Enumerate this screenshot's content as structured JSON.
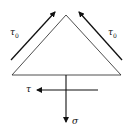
{
  "diagram": {
    "labels": {
      "tau0_left": "τ",
      "tau0_left_sub": "0",
      "tau0_right": "τ",
      "tau0_right_sub": "0",
      "tau": "τ",
      "sigma": "σ"
    },
    "colors": {
      "stroke": "#111111",
      "background": "#ffffff"
    }
  }
}
